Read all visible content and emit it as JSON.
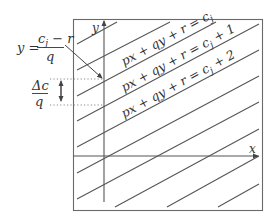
{
  "diagram": {
    "axes": {
      "x_label": "x",
      "y_label": "y"
    },
    "level_sets": [
      {
        "label": "px + qy + r = c",
        "sub": "j",
        "suffix": ""
      },
      {
        "label": "px + qy + r = c",
        "sub": "j",
        "suffix": " + 1"
      },
      {
        "label": "px + qy + r = c",
        "sub": "j",
        "suffix": " + 2"
      }
    ],
    "intercept_annotation": {
      "lhs": "y =",
      "numerator_c": "c",
      "numerator_sub": "j",
      "numerator_rest": " − r",
      "denominator": "q"
    },
    "spacing_annotation": {
      "numerator": "Δc",
      "denominator": "q"
    },
    "colors": {
      "line": "#555555",
      "frame": "#6a6a6a",
      "text": "#333333",
      "dotted": "#8a8a8a"
    }
  }
}
